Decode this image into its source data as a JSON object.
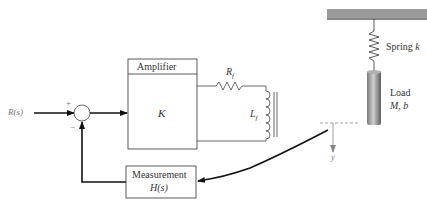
{
  "input": {
    "label": "R(s)",
    "plus": "+",
    "minus": "−"
  },
  "amplifier": {
    "title": "Amplifier",
    "gain": "K"
  },
  "field": {
    "resistor": "R",
    "resistor_sub": "f",
    "inductor": "L",
    "inductor_sub": "f"
  },
  "measurement": {
    "title": "Measurement",
    "tf": "H(s)"
  },
  "mechanical": {
    "spring": "Spring",
    "spring_sym": "k",
    "load": "Load",
    "load_params": "M, b",
    "output": "y"
  },
  "colors": {
    "line": "#111111",
    "ceiling": "#9a9a9a",
    "cylinder_dark": "#6b6b6b",
    "cylinder_light": "#c8c8c8",
    "dashed": "#888888"
  }
}
